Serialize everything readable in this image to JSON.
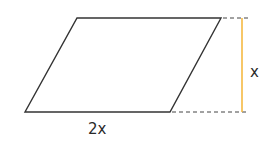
{
  "diagram": {
    "type": "parallelogram",
    "vertices": {
      "top_left": [
        77,
        18
      ],
      "top_right": [
        221,
        18
      ],
      "bottom_right": [
        170,
        112
      ],
      "bottom_left": [
        25,
        112
      ]
    },
    "base_label": "2x",
    "height_label": "x",
    "colors": {
      "outline": "#333333",
      "height_line": "#f5b942",
      "dashed": "#444444",
      "text": "#2a2a2a"
    }
  }
}
